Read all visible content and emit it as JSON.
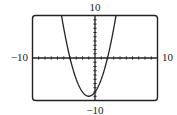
{
  "chart_data": {
    "type": "line",
    "title": "",
    "function": "y = x^2 + 2x - 8",
    "xlim": [
      -10,
      10
    ],
    "ylim": [
      -10,
      10
    ],
    "xscale": 1,
    "yscale": 1,
    "grid": false,
    "labels": {
      "ymax": "10",
      "ymin": "−10",
      "xmin": "−10",
      "xmax": "10"
    },
    "series": [
      {
        "name": "parabola",
        "coefficients": {
          "a": 1,
          "b": 2,
          "c": -8
        },
        "roots": [
          -4,
          2
        ],
        "vertex": [
          -1,
          -9
        ]
      }
    ],
    "colors": {
      "curve": "#222222",
      "frame": "#222222",
      "axes": "#222222"
    }
  }
}
